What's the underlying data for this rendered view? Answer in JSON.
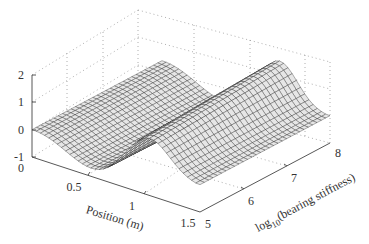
{
  "chart_data": {
    "type": "surface",
    "title": "",
    "xlabel": "Position (m)",
    "ylabel": "log10(bearing stiffness)",
    "ylabel_parts": {
      "prefix": "log",
      "subscript": "10",
      "suffix": "(bearing stiffness)"
    },
    "zlabel": "",
    "x_ticks": [
      "0",
      "0.5",
      "1",
      "1.5"
    ],
    "x_tick_values": [
      0,
      0.5,
      1,
      1.5
    ],
    "y_ticks": [
      "5",
      "6",
      "7",
      "8"
    ],
    "y_tick_values": [
      5,
      6,
      7,
      8
    ],
    "z_ticks": [
      "-1",
      "0",
      "1",
      "2"
    ],
    "z_tick_values": [
      -1,
      0,
      1,
      2
    ],
    "xlim": [
      0,
      1.5
    ],
    "ylim": [
      5,
      8
    ],
    "zlim": [
      -1,
      2
    ],
    "grid": true,
    "colormap": "monochrome mesh (black lines on light grey)",
    "sample_profile_low_stiffness": {
      "x": [
        0,
        0.25,
        0.5,
        0.75,
        1.0,
        1.25,
        1.5
      ],
      "z": [
        0.0,
        -0.7,
        -0.8,
        0.1,
        1.3,
        1.2,
        0.0
      ]
    },
    "sample_profile_high_stiffness": {
      "x": [
        0,
        0.25,
        0.5,
        0.75,
        1.0,
        1.25,
        1.5
      ],
      "z": [
        0.0,
        -0.8,
        -0.9,
        0.2,
        1.6,
        1.4,
        0.0
      ]
    }
  }
}
